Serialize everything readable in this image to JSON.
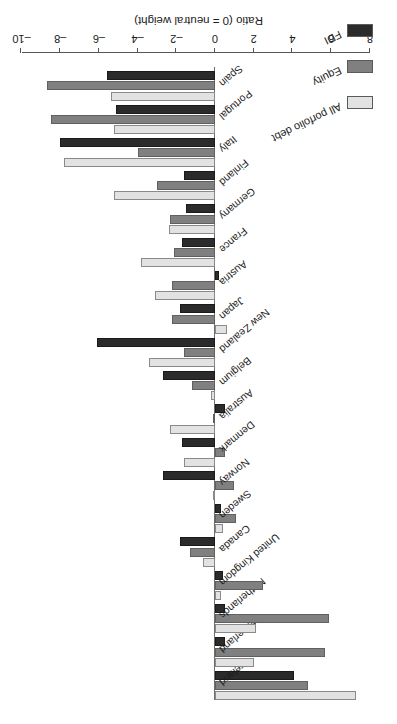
{
  "chart_data": {
    "type": "bar",
    "orientation": "horizontal",
    "title": "",
    "xlabel": "Ratio (0 = neutral weight)",
    "ylabel": "",
    "xlim": [
      8,
      -10
    ],
    "xticks": [
      8,
      6,
      4,
      2,
      0,
      -2,
      -4,
      -6,
      -8,
      -10
    ],
    "grid": false,
    "legend_position": "upper-left",
    "rotation_note": "figure rendered rotated 180 degrees",
    "categories": [
      "Ireland",
      "Switzerland",
      "Netherlands",
      "United Kingdom",
      "Canada",
      "Sweden",
      "Norway",
      "Denmark",
      "Australia",
      "Belgium",
      "New Zealand",
      "Japan",
      "Austria",
      "France",
      "Germany",
      "Finland",
      "Italy",
      "Portugal",
      "Spain"
    ],
    "series": [
      {
        "name": "All porfolio debt",
        "color": "#e2e2e2",
        "values": [
          7.3,
          2.0,
          2.1,
          0.3,
          -0.6,
          0.4,
          0.0,
          -1.6,
          -2.3,
          -0.2,
          -3.4,
          0.6,
          -3.1,
          -3.8,
          -2.4,
          -5.2,
          -7.8,
          -5.2,
          -5.4
        ]
      },
      {
        "name": "Equity",
        "color": "#808080",
        "values": [
          4.8,
          5.7,
          5.9,
          2.5,
          -1.3,
          1.1,
          1.0,
          0.5,
          -0.1,
          -1.2,
          -1.6,
          -2.2,
          -2.2,
          -2.1,
          -2.3,
          -3.0,
          -4.0,
          -8.5,
          -8.7
        ]
      },
      {
        "name": "FDI",
        "color": "#2b2b2b",
        "values": [
          4.1,
          0.5,
          0.5,
          0.4,
          -1.8,
          0.3,
          -2.7,
          -1.7,
          0.5,
          -2.7,
          -6.1,
          -1.8,
          0.2,
          -1.7,
          -1.5,
          -1.6,
          -8.0,
          -5.1,
          -5.6
        ]
      }
    ]
  },
  "legend": {
    "items": [
      {
        "label": "All porfolio debt",
        "swatch": "light-gray-swatch"
      },
      {
        "label": "Equity",
        "swatch": "mid-gray-swatch"
      },
      {
        "label": "FDI",
        "swatch": "dark-gray-swatch"
      }
    ]
  },
  "axis": {
    "title": "Ratio (0 = neutral weight)",
    "tick_labels": [
      "8",
      "6",
      "4",
      "2",
      "0",
      "–2",
      "–4",
      "–6",
      "–8",
      "–10"
    ]
  }
}
